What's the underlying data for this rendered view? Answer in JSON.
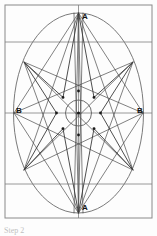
{
  "figure": {
    "caption": "Step 2",
    "labels": {
      "apex_top": "A",
      "apex_bottom": "A",
      "side_left": "B",
      "side_right": "B"
    },
    "colors": {
      "background": "#fdfdfd",
      "frame": "#8a8a8a",
      "guide_line": "#7f7f7f",
      "ellipse": "#6b6b6b",
      "star_line": "#4a4a4a",
      "node": "#1a1a1a",
      "label_text": "#111111",
      "caption_text": "#8d8d8d"
    },
    "geometry": {
      "canvas": {
        "width": 157,
        "height": 236
      },
      "frame": {
        "x": 5,
        "y": 5,
        "width": 147,
        "height": 213
      },
      "ellipse": {
        "cx": 78.5,
        "cy": 113,
        "rx": 65,
        "ry": 100
      },
      "inner_circle": {
        "cx": 78.5,
        "cy": 113,
        "r": 13
      },
      "node_circle": {
        "cx": 78.5,
        "cy": 113,
        "r": 22
      },
      "guides": {
        "horizontal_y": [
          42,
          113,
          184
        ],
        "vertical_x": [
          78.5
        ]
      },
      "star_points": [
        {
          "name": "A-top",
          "x": 78.5,
          "y": 13
        },
        {
          "name": "diag-top-right",
          "x": 133,
          "y": 62
        },
        {
          "name": "B-right",
          "x": 143,
          "y": 113
        },
        {
          "name": "diag-bot-right",
          "x": 133,
          "y": 170
        },
        {
          "name": "A-bottom",
          "x": 78.5,
          "y": 213
        },
        {
          "name": "diag-bot-left",
          "x": 24,
          "y": 170
        },
        {
          "name": "B-left",
          "x": 14,
          "y": 113
        },
        {
          "name": "diag-top-left",
          "x": 24,
          "y": 62
        }
      ],
      "inner_nodes": [
        {
          "x": 78.5,
          "y": 91
        },
        {
          "x": 94.0,
          "y": 97.4
        },
        {
          "x": 100.5,
          "y": 113
        },
        {
          "x": 94.0,
          "y": 128.6
        },
        {
          "x": 78.5,
          "y": 135
        },
        {
          "x": 63.0,
          "y": 128.6
        },
        {
          "x": 56.5,
          "y": 113
        },
        {
          "x": 63.0,
          "y": 97.4
        }
      ]
    }
  }
}
